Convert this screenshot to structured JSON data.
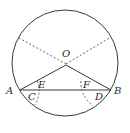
{
  "diagram": {
    "type": "geometry",
    "colors": {
      "stroke": "#3a3a3a",
      "label": "#2a2a2a",
      "background": "#ffffff"
    },
    "circle": {
      "cx": 65,
      "cy": 63,
      "r": 53
    },
    "points": {
      "O": {
        "label": "O",
        "x": 66,
        "y": 65
      },
      "A": {
        "label": "A",
        "x": 20,
        "y": 90
      },
      "B": {
        "label": "B",
        "x": 111,
        "y": 90
      },
      "C": {
        "label": "C"
      },
      "D": {
        "label": "D"
      },
      "E": {
        "label": "E"
      },
      "F": {
        "label": "F"
      }
    },
    "solid_segments": [
      "OA",
      "OB",
      "AB"
    ],
    "dashed_segments": [
      "O to upper-left circle point",
      "O to upper-right circle point"
    ],
    "dashed_arcs": [
      "arc through E to C",
      "arc through F to D"
    ]
  }
}
